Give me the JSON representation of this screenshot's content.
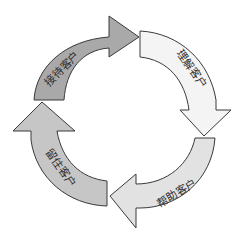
{
  "diagram": {
    "type": "cycle",
    "direction": "clockwise",
    "center": [
      121,
      117
    ],
    "steps": [
      {
        "label": "接待客户",
        "position": "top-left",
        "fill": "#a9a9a9"
      },
      {
        "label": "理解客户",
        "position": "top-right",
        "fill": "#f4f4f4"
      },
      {
        "label": "帮助客户",
        "position": "bottom-right",
        "fill": "#e2e2e2"
      },
      {
        "label": "留住客户",
        "position": "bottom-left",
        "fill": "#c6c6c6"
      }
    ],
    "stroke": "#3a3a3a",
    "background": "#ffffff"
  }
}
